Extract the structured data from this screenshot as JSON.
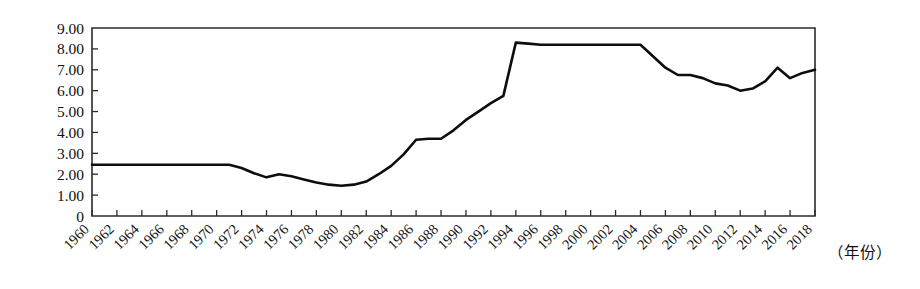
{
  "chart_data": {
    "type": "line",
    "title": "",
    "subtitle": "",
    "xlabel": "（年份）",
    "ylabel": "",
    "xlim": [
      1960,
      2018
    ],
    "ylim": [
      0,
      9
    ],
    "grid": false,
    "legend": null,
    "y_tick_labels": [
      "9.00",
      "8.00",
      "7.00",
      "6.00",
      "5.00",
      "4.00",
      "3.00",
      "2.00",
      "1.00",
      "0"
    ],
    "y_tick_values": [
      9,
      8,
      7,
      6,
      5,
      4,
      3,
      2,
      1,
      0
    ],
    "x_tick_labels": [
      "1960",
      "1962",
      "1964",
      "1966",
      "1968",
      "1970",
      "1972",
      "1974",
      "1976",
      "1978",
      "1980",
      "1982",
      "1984",
      "1986",
      "1988",
      "1990",
      "1992",
      "1994",
      "1996",
      "1998",
      "2000",
      "2002",
      "2004",
      "2006",
      "2008",
      "2010",
      "2012",
      "2014",
      "2016",
      "2018"
    ],
    "x": [
      1960,
      1961,
      1962,
      1963,
      1964,
      1965,
      1966,
      1967,
      1968,
      1969,
      1970,
      1971,
      1972,
      1973,
      1974,
      1975,
      1976,
      1977,
      1978,
      1979,
      1980,
      1981,
      1982,
      1983,
      1984,
      1985,
      1986,
      1987,
      1988,
      1989,
      1990,
      1991,
      1992,
      1993,
      1994,
      1995,
      1996,
      1997,
      1998,
      1999,
      2000,
      2001,
      2002,
      2003,
      2004,
      2005,
      2006,
      2007,
      2008,
      2009,
      2010,
      2011,
      2012,
      2013,
      2014,
      2015,
      2016,
      2017,
      2018
    ],
    "values": [
      2.45,
      2.45,
      2.45,
      2.45,
      2.45,
      2.45,
      2.45,
      2.45,
      2.45,
      2.45,
      2.45,
      2.45,
      2.3,
      2.05,
      1.85,
      2.0,
      1.9,
      1.75,
      1.6,
      1.5,
      1.45,
      1.5,
      1.65,
      2.0,
      2.4,
      2.95,
      3.65,
      3.7,
      3.7,
      4.1,
      4.6,
      5.0,
      5.4,
      5.75,
      8.3,
      8.25,
      8.2,
      8.2,
      8.2,
      8.2,
      8.2,
      8.2,
      8.2,
      8.2,
      8.2,
      7.65,
      7.1,
      6.75,
      6.75,
      6.6,
      6.35,
      6.25,
      6.0,
      6.1,
      6.45,
      7.1,
      6.6,
      6.85,
      7.0
    ],
    "series_name": ""
  },
  "chart": {
    "x_axis_caption": "（年份）"
  }
}
